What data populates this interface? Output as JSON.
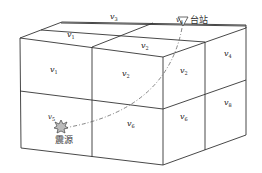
{
  "diagram": {
    "type": "3d-block-model",
    "cells": {
      "top_back_right": {
        "var": "v",
        "sub": "3"
      },
      "top_front_left": {
        "var": "v",
        "sub": "1"
      },
      "top_front_right": {
        "var": "v",
        "sub": "2"
      },
      "top_back_station": {
        "var": "v",
        "sub": "4"
      },
      "front_upper_left": {
        "var": "v",
        "sub": "1"
      },
      "front_upper_right": {
        "var": "v",
        "sub": "2"
      },
      "side_upper_front": {
        "var": "v",
        "sub": "2"
      },
      "side_upper_back": {
        "var": "v",
        "sub": "4"
      },
      "front_lower_left": {
        "var": "v",
        "sub": "5"
      },
      "front_lower_right": {
        "var": "v",
        "sub": "6"
      },
      "side_lower_front": {
        "var": "v",
        "sub": "6"
      },
      "side_lower_back": {
        "var": "v",
        "sub": "8"
      }
    },
    "station_label": "台站",
    "source_label": "震源",
    "colors": {
      "line": "#333333",
      "ray": "#555555",
      "text": "#222222"
    }
  }
}
